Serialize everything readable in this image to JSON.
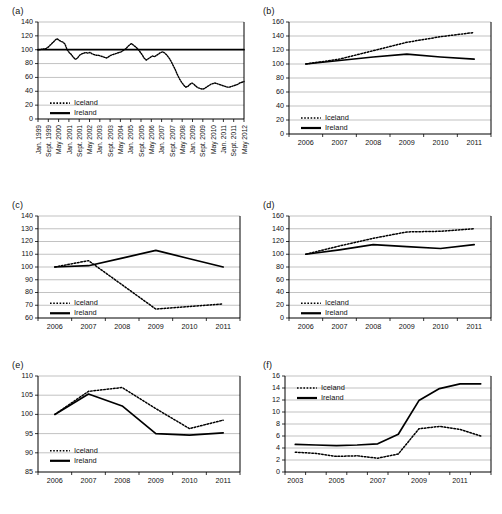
{
  "figure": {
    "panel_labels": [
      "(a)",
      "(b)",
      "(c)",
      "(d)",
      "(e)",
      "(f)"
    ],
    "legend": {
      "iceland": "Iceland",
      "ireland": "Ireland"
    },
    "line_color": "#000000",
    "grid_color": "#a8a8a8"
  },
  "chart_data": [
    {
      "id": "a",
      "type": "line",
      "title": "(a)",
      "xlabel": "",
      "ylabel": "",
      "ylim": [
        0,
        140
      ],
      "yticks": [
        0,
        20,
        40,
        60,
        80,
        100,
        120,
        140
      ],
      "grid": true,
      "legend_position": "inside-lower-left",
      "x_tick_labels": [
        "Jan. 1999",
        "Sept. 1999",
        "May 2000",
        "Jan. 2001",
        "Sept. 2001",
        "May 2002",
        "Jan. 2003",
        "Sept. 2003",
        "May 2004",
        "Jan. 2005",
        "Sept. 2005",
        "May 2006",
        "Jan. 2007",
        "Sept. 2007",
        "May 2008",
        "Jan. 2009",
        "Sept. 2009",
        "May 2010",
        "Jan. 2011",
        "Sept. 2011",
        "May 2012"
      ],
      "x_label_rotation": 90,
      "series": [
        {
          "name": "Iceland",
          "style": "dotted",
          "values": [
            100,
            100,
            101,
            101,
            102,
            104,
            107,
            110,
            113,
            116,
            114,
            112,
            111,
            108,
            100,
            96,
            93,
            89,
            86,
            88,
            92,
            94,
            95,
            96,
            95,
            96,
            94,
            93,
            92,
            92,
            91,
            90,
            89,
            88,
            90,
            92,
            93,
            94,
            95,
            96,
            97,
            99,
            101,
            104,
            107,
            109,
            106,
            104,
            101,
            97,
            93,
            88,
            85,
            87,
            89,
            91,
            90,
            92,
            94,
            96,
            97,
            95,
            92,
            88,
            83,
            77,
            71,
            64,
            58,
            53,
            49,
            46,
            47,
            50,
            52,
            50,
            47,
            45,
            44,
            43,
            44,
            46,
            48,
            50,
            51,
            52,
            51,
            50,
            49,
            48,
            47,
            46,
            46,
            47,
            48,
            49,
            50,
            52,
            53,
            54
          ]
        },
        {
          "name": "Ireland",
          "style": "solid",
          "values": [
            100,
            100,
            100,
            100,
            100,
            100,
            100,
            100,
            100,
            100,
            100,
            100,
            100,
            100,
            100,
            100,
            100,
            100,
            100,
            100,
            100,
            100,
            100,
            100,
            100,
            100,
            100,
            100,
            100,
            100,
            100,
            100,
            100,
            100,
            100,
            100,
            100,
            100,
            100,
            100,
            100,
            100,
            100,
            100,
            100,
            100,
            100,
            100,
            100,
            100,
            100,
            100,
            100,
            100,
            100,
            100,
            100,
            100,
            100,
            100,
            100,
            100,
            100,
            100,
            100,
            100,
            100,
            100,
            100,
            100,
            100,
            100,
            100,
            100,
            100,
            100,
            100,
            100,
            100,
            100,
            100,
            100,
            100,
            100,
            100,
            100,
            100,
            100,
            100,
            100,
            100,
            100,
            100,
            100,
            100,
            100,
            100,
            100,
            100,
            100
          ]
        }
      ]
    },
    {
      "id": "b",
      "type": "line",
      "title": "(b)",
      "xlabel": "",
      "ylabel": "",
      "ylim": [
        0,
        160
      ],
      "yticks": [
        0,
        20,
        40,
        60,
        80,
        100,
        120,
        140,
        160
      ],
      "grid": true,
      "legend_position": "inside-lower-left",
      "categories": [
        "2006",
        "2007",
        "2008",
        "2009",
        "2010",
        "2011"
      ],
      "series": [
        {
          "name": "Iceland",
          "style": "dotted",
          "values": [
            100,
            107,
            119,
            131,
            139,
            145
          ]
        },
        {
          "name": "Ireland",
          "style": "solid",
          "values": [
            100,
            105,
            110,
            114,
            110,
            107
          ]
        }
      ]
    },
    {
      "id": "c",
      "type": "line",
      "title": "(c)",
      "xlabel": "",
      "ylabel": "",
      "ylim": [
        60,
        140
      ],
      "yticks": [
        60,
        70,
        80,
        90,
        100,
        110,
        120,
        130,
        140
      ],
      "grid": true,
      "legend_position": "inside-lower-left",
      "categories": [
        "2006",
        "2007",
        "2008",
        "2009",
        "2010",
        "2011"
      ],
      "series": [
        {
          "name": "Iceland",
          "style": "dotted",
          "values": [
            100,
            105,
            86,
            67,
            69,
            71
          ]
        },
        {
          "name": "Ireland",
          "style": "solid",
          "values": [
            100,
            101,
            107,
            113,
            106.5,
            100
          ]
        }
      ]
    },
    {
      "id": "d",
      "type": "line",
      "title": "(d)",
      "xlabel": "",
      "ylabel": "",
      "ylim": [
        0,
        160
      ],
      "yticks": [
        0,
        20,
        40,
        60,
        80,
        100,
        120,
        140,
        160
      ],
      "grid": true,
      "legend_position": "inside-lower-left",
      "categories": [
        "2006",
        "2007",
        "2008",
        "2009",
        "2010",
        "2011"
      ],
      "series": [
        {
          "name": "Iceland",
          "style": "dotted",
          "values": [
            100,
            113,
            125,
            135,
            136,
            140
          ]
        },
        {
          "name": "Ireland",
          "style": "solid",
          "values": [
            100,
            107,
            115,
            112,
            109,
            115
          ]
        }
      ]
    },
    {
      "id": "e",
      "type": "line",
      "title": "(e)",
      "xlabel": "",
      "ylabel": "",
      "ylim": [
        85,
        110
      ],
      "yticks": [
        85,
        90,
        95,
        100,
        105,
        110
      ],
      "grid": true,
      "legend_position": "inside-lower-left",
      "categories": [
        "2006",
        "2007",
        "2008",
        "2009",
        "2010",
        "2011"
      ],
      "series": [
        {
          "name": "Iceland",
          "style": "dotted",
          "values": [
            100,
            106,
            107,
            101.5,
            96.3,
            98.5
          ]
        },
        {
          "name": "Ireland",
          "style": "solid",
          "values": [
            100,
            105.3,
            102.2,
            95,
            94.6,
            95.2
          ]
        }
      ]
    },
    {
      "id": "f",
      "type": "line",
      "title": "(f)",
      "xlabel": "",
      "ylabel": "",
      "ylim": [
        0,
        16
      ],
      "yticks": [
        0,
        2,
        4,
        6,
        8,
        10,
        12,
        14,
        16
      ],
      "grid": true,
      "legend_position": "inside-upper-left",
      "x": [
        2003,
        2004,
        2005,
        2006,
        2007,
        2008,
        2009,
        2010,
        2011,
        2012
      ],
      "x_tick_labels": [
        "2003",
        "",
        "2005",
        "",
        "2007",
        "",
        "2009",
        "",
        "2011",
        ""
      ],
      "series": [
        {
          "name": "Iceland",
          "style": "dotted",
          "values": [
            3.3,
            3.1,
            2.6,
            2.7,
            2.3,
            3.0,
            7.2,
            7.6,
            7.1,
            6.0
          ]
        },
        {
          "name": "Ireland",
          "style": "solid",
          "values": [
            4.6,
            4.5,
            4.4,
            4.5,
            4.7,
            6.3,
            11.9,
            13.9,
            14.7,
            14.7
          ]
        }
      ]
    }
  ]
}
